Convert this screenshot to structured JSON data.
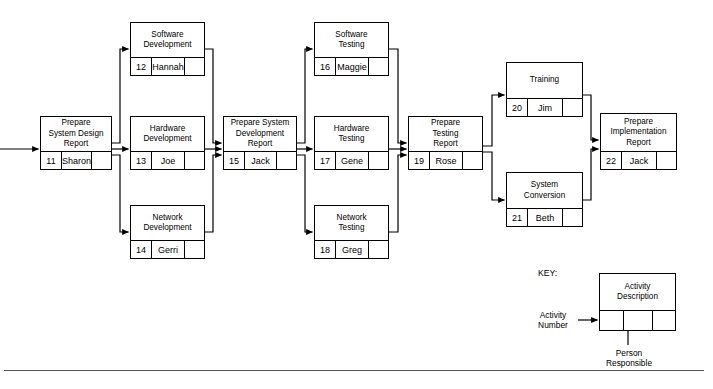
{
  "diagram": {
    "type": "project-network-diagram",
    "nodes": [
      {
        "id": "n11",
        "activity_number": "11",
        "description": "Prepare\nSystem Design\nReport",
        "person": "Sharon",
        "blank": ""
      },
      {
        "id": "n12",
        "activity_number": "12",
        "description": "Software\nDevelopment",
        "person": "Hannah",
        "blank": ""
      },
      {
        "id": "n13",
        "activity_number": "13",
        "description": "Hardware\nDevelopment",
        "person": "Joe",
        "blank": ""
      },
      {
        "id": "n14",
        "activity_number": "14",
        "description": "Network\nDevelopment",
        "person": "Gerri",
        "blank": ""
      },
      {
        "id": "n15",
        "activity_number": "15",
        "description": "Prepare System\nDevelopment\nReport",
        "person": "Jack",
        "blank": ""
      },
      {
        "id": "n16",
        "activity_number": "16",
        "description": "Software\nTesting",
        "person": "Maggie",
        "blank": ""
      },
      {
        "id": "n17",
        "activity_number": "17",
        "description": "Hardware\nTesting",
        "person": "Gene",
        "blank": ""
      },
      {
        "id": "n18",
        "activity_number": "18",
        "description": "Network\nTesting",
        "person": "Greg",
        "blank": ""
      },
      {
        "id": "n19",
        "activity_number": "19",
        "description": "Prepare\nTesting\nReport",
        "person": "Rose",
        "blank": ""
      },
      {
        "id": "n20",
        "activity_number": "20",
        "description": "Training",
        "person": "Jim",
        "blank": ""
      },
      {
        "id": "n21",
        "activity_number": "21",
        "description": "System\nConversion",
        "person": "Beth",
        "blank": ""
      },
      {
        "id": "n22",
        "activity_number": "22",
        "description": "Prepare\nImplementation\nReport",
        "person": "Jack",
        "blank": ""
      }
    ]
  },
  "key": {
    "heading": "KEY:",
    "activity_number_label": "Activity\nNumber",
    "activity_description_label": "Activity\nDescription",
    "person_responsible_label": "Person\nResponsible",
    "sample_number": "",
    "sample_person": "",
    "sample_blank": ""
  },
  "colors": {
    "stroke": "#000000",
    "background": "#ffffff",
    "rule": "#555555"
  }
}
